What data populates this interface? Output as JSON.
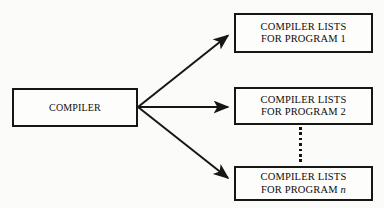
{
  "diagram": {
    "background_color": "#fbfbfa",
    "stroke_color": "#161616",
    "text_color": "#0d0d0d",
    "source": {
      "id": "compiler",
      "label": "COMPILER"
    },
    "outputs": [
      {
        "id": "compiler-lists-program-1",
        "line1": "COMPILER LISTS",
        "line2_prefix": "FOR PROGRAM ",
        "line2_value": "1",
        "value_italic": false
      },
      {
        "id": "compiler-lists-program-2",
        "line1": "COMPILER LISTS",
        "line2_prefix": "FOR PROGRAM ",
        "line2_value": "2",
        "value_italic": false
      },
      {
        "id": "compiler-lists-program-n",
        "line1": "COMPILER LISTS",
        "line2_prefix": "FOR PROGRAM ",
        "line2_value": "n",
        "value_italic": true
      }
    ],
    "connectors": [
      {
        "id": "arrow-to-program-1",
        "direction": "up-right",
        "from": "compiler",
        "to": "compiler-lists-program-1"
      },
      {
        "id": "arrow-to-program-2",
        "direction": "right",
        "from": "compiler",
        "to": "compiler-lists-program-2"
      },
      {
        "id": "arrow-to-program-n",
        "direction": "down-right",
        "from": "compiler",
        "to": "compiler-lists-program-n"
      }
    ],
    "ellipsis": {
      "id": "vertical-ellipsis",
      "symbol": "vertical-dots",
      "dot_count": 7,
      "meaning": "continuation between program 2 and program n"
    }
  }
}
